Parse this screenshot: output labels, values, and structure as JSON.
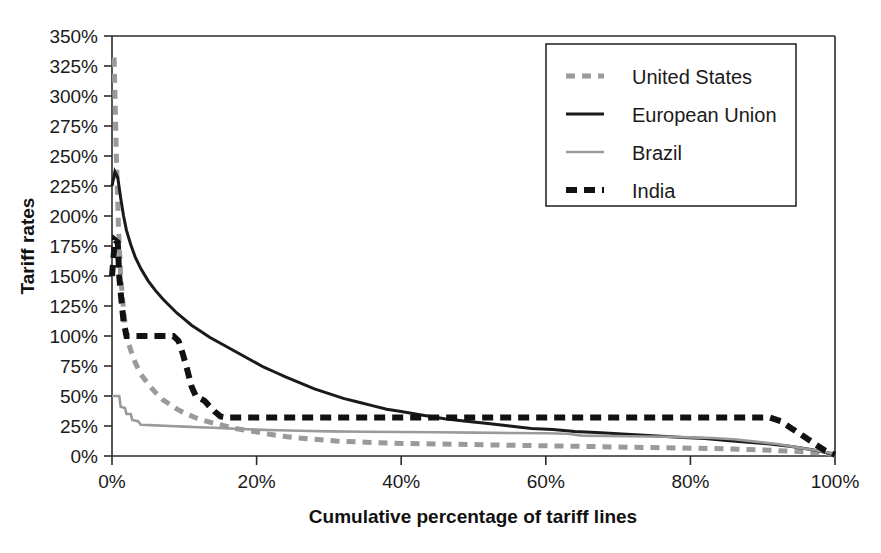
{
  "chart_data": {
    "type": "line",
    "title": "",
    "xlabel": "Cumulative percentage of tariff lines",
    "ylabel": "Tariff rates",
    "xlim": [
      0,
      100
    ],
    "ylim": [
      0,
      350
    ],
    "grid": false,
    "legend_position": "top-right",
    "x_tick_labels": [
      "0%",
      "20%",
      "40%",
      "60%",
      "80%",
      "100%"
    ],
    "x_tick_values": [
      0,
      20,
      40,
      60,
      80,
      100
    ],
    "y_tick_labels": [
      "350%",
      "325%",
      "300%",
      "275%",
      "250%",
      "225%",
      "200%",
      "175%",
      "150%",
      "125%",
      "100%",
      "75%",
      "50%",
      "25%",
      "0%"
    ],
    "y_tick_values": [
      350,
      325,
      300,
      275,
      250,
      225,
      200,
      175,
      150,
      125,
      100,
      75,
      50,
      25,
      0
    ],
    "series": [
      {
        "name": "United States",
        "color": "#9a9a9a",
        "style": "dashed",
        "width": 5,
        "dash": "9,7",
        "points": [
          [
            0.0,
            330
          ],
          [
            0.3,
            330
          ],
          [
            0.6,
            250
          ],
          [
            0.9,
            190
          ],
          [
            1.2,
            150
          ],
          [
            1.6,
            122
          ],
          [
            2.0,
            100
          ],
          [
            2.6,
            88
          ],
          [
            3.2,
            78
          ],
          [
            4.0,
            68
          ],
          [
            5.0,
            60
          ],
          [
            6.0,
            53
          ],
          [
            7.0,
            47
          ],
          [
            8.0,
            43
          ],
          [
            9.0,
            39
          ],
          [
            10.0,
            36
          ],
          [
            11.5,
            32
          ],
          [
            13.0,
            29
          ],
          [
            15.0,
            26
          ],
          [
            17.0,
            23
          ],
          [
            19.0,
            21
          ],
          [
            21.0,
            19
          ],
          [
            23.0,
            17
          ],
          [
            25.0,
            15.5
          ],
          [
            28.0,
            14
          ],
          [
            31.0,
            12.5
          ],
          [
            35.0,
            11.5
          ],
          [
            40.0,
            10.5
          ],
          [
            45.0,
            10
          ],
          [
            50.0,
            9.5
          ],
          [
            55.0,
            9
          ],
          [
            60.0,
            8.5
          ],
          [
            65.0,
            8
          ],
          [
            70.0,
            7.5
          ],
          [
            75.0,
            7
          ],
          [
            80.0,
            6.5
          ],
          [
            85.0,
            6
          ],
          [
            90.0,
            5
          ],
          [
            94.0,
            4
          ],
          [
            97.0,
            3
          ],
          [
            99.0,
            2
          ],
          [
            100.0,
            1
          ]
        ]
      },
      {
        "name": "European Union",
        "color": "#1a1a1a",
        "style": "solid",
        "width": 3,
        "dash": "",
        "points": [
          [
            0.0,
            225
          ],
          [
            0.4,
            237
          ],
          [
            0.8,
            232
          ],
          [
            1.2,
            215
          ],
          [
            1.6,
            200
          ],
          [
            2.0,
            188
          ],
          [
            2.6,
            176
          ],
          [
            3.2,
            166
          ],
          [
            4.0,
            156
          ],
          [
            5.0,
            146
          ],
          [
            6.0,
            138
          ],
          [
            7.0,
            131
          ],
          [
            8.0,
            125
          ],
          [
            9.0,
            119
          ],
          [
            10.0,
            114
          ],
          [
            11.0,
            109
          ],
          [
            12.0,
            105
          ],
          [
            13.5,
            99
          ],
          [
            15.0,
            94
          ],
          [
            16.5,
            89
          ],
          [
            18.0,
            84
          ],
          [
            19.5,
            79
          ],
          [
            21.0,
            74
          ],
          [
            22.5,
            70
          ],
          [
            24.0,
            66
          ],
          [
            26.0,
            61
          ],
          [
            28.0,
            56
          ],
          [
            30.0,
            52
          ],
          [
            32.0,
            48
          ],
          [
            34.0,
            45
          ],
          [
            36.0,
            42
          ],
          [
            38.0,
            39
          ],
          [
            40.0,
            37
          ],
          [
            43.0,
            34
          ],
          [
            46.0,
            31
          ],
          [
            49.0,
            29
          ],
          [
            52.0,
            27
          ],
          [
            55.0,
            25
          ],
          [
            58.0,
            23
          ],
          [
            61.0,
            22
          ],
          [
            64.0,
            20.5
          ],
          [
            67.0,
            19.5
          ],
          [
            70.0,
            18.5
          ],
          [
            73.0,
            17.5
          ],
          [
            76.0,
            16.5
          ],
          [
            79.0,
            15.5
          ],
          [
            82.0,
            14.5
          ],
          [
            85.0,
            13
          ],
          [
            88.0,
            11.5
          ],
          [
            91.0,
            10
          ],
          [
            94.0,
            8
          ],
          [
            96.0,
            6
          ],
          [
            98.0,
            4
          ],
          [
            100.0,
            1
          ]
        ]
      },
      {
        "name": "Brazil",
        "color": "#9a9a9a",
        "style": "solid",
        "width": 2.6,
        "dash": "",
        "points": [
          [
            0.0,
            50
          ],
          [
            1.0,
            50
          ],
          [
            1.2,
            41
          ],
          [
            1.8,
            40
          ],
          [
            2.0,
            35
          ],
          [
            2.6,
            35
          ],
          [
            2.8,
            30
          ],
          [
            3.6,
            29
          ],
          [
            4.0,
            26
          ],
          [
            6.0,
            25.5
          ],
          [
            8.0,
            25
          ],
          [
            10.0,
            24.5
          ],
          [
            12.0,
            24
          ],
          [
            14.0,
            23.5
          ],
          [
            16.0,
            23
          ],
          [
            18.0,
            22.5
          ],
          [
            20.0,
            22
          ],
          [
            23.0,
            21.5
          ],
          [
            26.0,
            21
          ],
          [
            30.0,
            20.5
          ],
          [
            35.0,
            20.2
          ],
          [
            40.0,
            20
          ],
          [
            45.0,
            19.8
          ],
          [
            50.0,
            19.5
          ],
          [
            55.0,
            19.2
          ],
          [
            60.0,
            19
          ],
          [
            63.0,
            18.5
          ],
          [
            65.0,
            17
          ],
          [
            68.0,
            16.8
          ],
          [
            71.0,
            16.5
          ],
          [
            74.0,
            16.2
          ],
          [
            77.0,
            16
          ],
          [
            80.0,
            15.5
          ],
          [
            83.0,
            15
          ],
          [
            86.0,
            14
          ],
          [
            89.0,
            12
          ],
          [
            92.0,
            10
          ],
          [
            95.0,
            7
          ],
          [
            97.0,
            5
          ],
          [
            99.0,
            3
          ],
          [
            100.0,
            1
          ]
        ]
      },
      {
        "name": "India",
        "color": "#111111",
        "style": "dashed",
        "width": 6,
        "dash": "11,7",
        "points": [
          [
            0.0,
            150
          ],
          [
            0.4,
            180
          ],
          [
            0.8,
            178
          ],
          [
            1.0,
            150
          ],
          [
            1.3,
            130
          ],
          [
            1.6,
            112
          ],
          [
            2.0,
            100
          ],
          [
            3.0,
            100
          ],
          [
            5.0,
            100
          ],
          [
            7.0,
            100
          ],
          [
            8.5,
            100
          ],
          [
            9.2,
            96
          ],
          [
            9.8,
            85
          ],
          [
            10.4,
            72
          ],
          [
            11.0,
            58
          ],
          [
            11.6,
            50
          ],
          [
            12.2,
            48
          ],
          [
            12.8,
            46
          ],
          [
            13.4,
            42
          ],
          [
            14.2,
            37
          ],
          [
            15.0,
            33
          ],
          [
            16.0,
            32
          ],
          [
            20.0,
            32
          ],
          [
            30.0,
            32
          ],
          [
            40.0,
            32
          ],
          [
            50.0,
            32
          ],
          [
            60.0,
            32
          ],
          [
            70.0,
            32
          ],
          [
            80.0,
            32
          ],
          [
            88.0,
            32
          ],
          [
            91.0,
            32
          ],
          [
            92.5,
            29
          ],
          [
            94.0,
            23
          ],
          [
            95.5,
            17
          ],
          [
            97.0,
            11
          ],
          [
            98.5,
            5
          ],
          [
            100.0,
            1
          ]
        ]
      }
    ]
  },
  "legend": {
    "items": [
      {
        "label": "United States"
      },
      {
        "label": "European Union"
      },
      {
        "label": "Brazil"
      },
      {
        "label": "India"
      }
    ]
  }
}
